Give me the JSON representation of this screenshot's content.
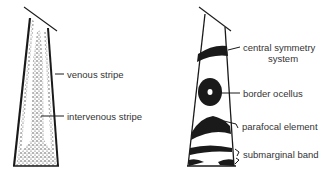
{
  "left_diagram": {
    "title": "wing cell with venous and intervenous stripes",
    "labels": {
      "venous": "venous stripe",
      "intervenous": "intervenous stripe"
    }
  },
  "right_diagram": {
    "title": "wing cell with nymphalid ground plan elements",
    "labels": {
      "central_symmetry_line1": "central symmetry",
      "central_symmetry_line2": "system",
      "border_ocellus": "border ocellus",
      "parafocal": "parafocal element",
      "submarginal": "submarginal band"
    }
  },
  "colors": {
    "ink": "#1a1a1a",
    "text": "#333333",
    "background": "#ffffff"
  }
}
